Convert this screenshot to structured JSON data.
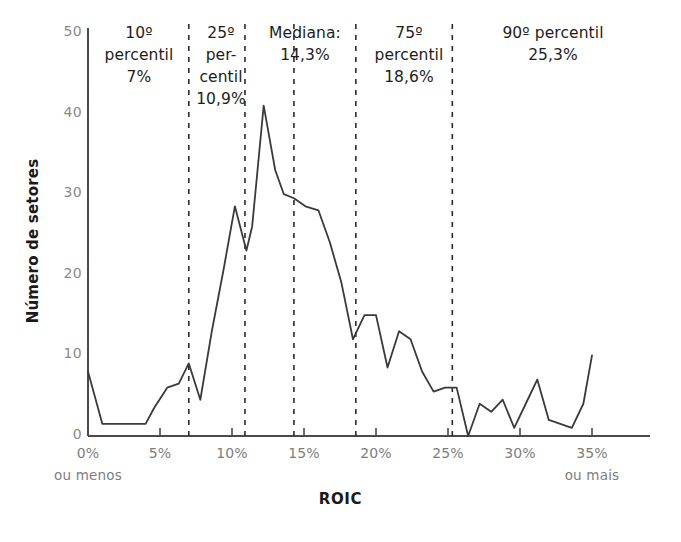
{
  "chart_data": {
    "type": "line",
    "title": "",
    "xlabel": "ROIC",
    "ylabel": "Número de setores",
    "xlim": [
      0,
      35
    ],
    "ylim": [
      0,
      50
    ],
    "grid": false,
    "legend": null,
    "x_tick_labels": [
      "0%",
      "5%",
      "10%",
      "15%",
      "20%",
      "25%",
      "30%",
      "35%"
    ],
    "x_tick_values": [
      0,
      5,
      10,
      15,
      20,
      25,
      30,
      35
    ],
    "x_tick_sublabels": {
      "first": "ou menos",
      "last": "ou mais"
    },
    "y_tick_labels": [
      "0",
      "10",
      "20",
      "30",
      "40",
      "50"
    ],
    "y_tick_values": [
      0,
      10,
      20,
      30,
      40,
      50
    ],
    "x": [
      0,
      1,
      2,
      3,
      4,
      4.6,
      5.5,
      6.3,
      7,
      7.8,
      8.6,
      9.4,
      10.2,
      11,
      11.4,
      12.2,
      13,
      13.6,
      14.3,
      15.1,
      16,
      16.8,
      17.6,
      18.4,
      19.2,
      20,
      20.8,
      21.6,
      22.4,
      23.2,
      24,
      24.8,
      25.6,
      26.4,
      27.2,
      28,
      28.8,
      29.6,
      30.4,
      31.2,
      32,
      32.8,
      33.6,
      34.4,
      35
    ],
    "y": [
      8,
      1.5,
      1.5,
      1.5,
      1.5,
      3.5,
      6,
      6.5,
      9,
      4.5,
      13,
      20.5,
      28.5,
      23,
      26,
      41,
      33,
      30,
      29.5,
      28.5,
      28,
      24,
      19,
      12,
      15,
      15,
      8.5,
      13,
      12,
      8,
      5.5,
      6,
      6,
      0,
      4,
      3,
      4.5,
      1,
      4,
      7,
      2,
      1.5,
      1,
      4,
      10
    ],
    "series_color": "#3a3a3a",
    "annotation_lines": [
      {
        "x": 7,
        "label": "10º percentil 7%"
      },
      {
        "x": 10.9,
        "label": "25º percentil 10,9%"
      },
      {
        "x": 14.3,
        "label": "Mediana: 14,3%"
      },
      {
        "x": 18.6,
        "label": "75º percentil 18,6%"
      },
      {
        "x": 25.3,
        "label": "90º percentil 25,3%"
      }
    ]
  },
  "axes": {
    "y_title": "Número de setores",
    "x_title": "ROIC",
    "y_ticks": [
      "50",
      "40",
      "30",
      "20",
      "10",
      "0"
    ],
    "x_ticks": [
      "0%",
      "5%",
      "10%",
      "15%",
      "20%",
      "25%",
      "30%",
      "35%"
    ],
    "x_first_sub": "ou menos",
    "x_last_sub": "ou mais"
  },
  "annotations": [
    {
      "line1": "10º",
      "line2": "percentil",
      "line3": "7%"
    },
    {
      "line1": "25º",
      "line2": "per-",
      "line3": "centil",
      "line4": "10,9%"
    },
    {
      "line1": "Mediana:",
      "line2": "14,3%"
    },
    {
      "line1": "75º",
      "line2": "percentil",
      "line3": "18,6%"
    },
    {
      "line1": "90º percentil",
      "line2": "25,3%"
    }
  ],
  "colors": {
    "line": "#3a3a3a",
    "axis": "#4a4a4a",
    "tick_text": "#7d7d7d",
    "annotation_text": "#1d1d1d",
    "dashed": "#2b2b2b"
  }
}
